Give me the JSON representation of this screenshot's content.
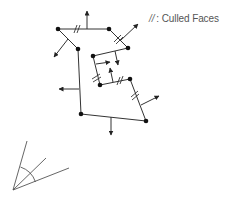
{
  "legend": {
    "symbol": "//",
    "label": ": Culled Faces"
  },
  "colors": {
    "line": "#333333",
    "vertex": "#111111",
    "frustum": "#555555",
    "legend_text": "#555555"
  },
  "diagram": {
    "vertices": [
      {
        "id": "A",
        "x": 58,
        "y": 29
      },
      {
        "id": "C",
        "x": 109,
        "y": 29
      },
      {
        "id": "D",
        "x": 128,
        "y": 48
      },
      {
        "id": "B",
        "x": 78,
        "y": 49
      },
      {
        "id": "E",
        "x": 93,
        "y": 56
      },
      {
        "id": "F",
        "x": 100,
        "y": 85
      },
      {
        "id": "G",
        "x": 130,
        "y": 79
      },
      {
        "id": "H",
        "x": 146,
        "y": 121
      },
      {
        "id": "I",
        "x": 81,
        "y": 114
      }
    ],
    "edges": [
      {
        "from": "A",
        "to": "C",
        "culled": true
      },
      {
        "from": "C",
        "to": "D",
        "culled": true
      },
      {
        "from": "D",
        "to": "E",
        "culled": false
      },
      {
        "from": "E",
        "to": "F",
        "culled": true
      },
      {
        "from": "F",
        "to": "G",
        "culled": true
      },
      {
        "from": "G",
        "to": "H",
        "culled": true
      },
      {
        "from": "H",
        "to": "I",
        "culled": false
      },
      {
        "from": "I",
        "to": "B",
        "culled": false
      },
      {
        "from": "B",
        "to": "A",
        "culled": false
      }
    ],
    "normals": [
      {
        "edge": "A-C",
        "direction": "up"
      },
      {
        "edge": "C-D",
        "direction": "up-right"
      },
      {
        "edge": "D-E",
        "direction": "down"
      },
      {
        "edge": "E-F",
        "direction": "right"
      },
      {
        "edge": "F-G",
        "direction": "up"
      },
      {
        "edge": "G-H",
        "direction": "right"
      },
      {
        "edge": "H-I",
        "direction": "down"
      },
      {
        "edge": "I-B",
        "direction": "left"
      },
      {
        "edge": "B-A",
        "direction": "down-left"
      }
    ],
    "camera": {
      "label": "view frustum",
      "apex": {
        "x": 13,
        "y": 190
      }
    }
  }
}
